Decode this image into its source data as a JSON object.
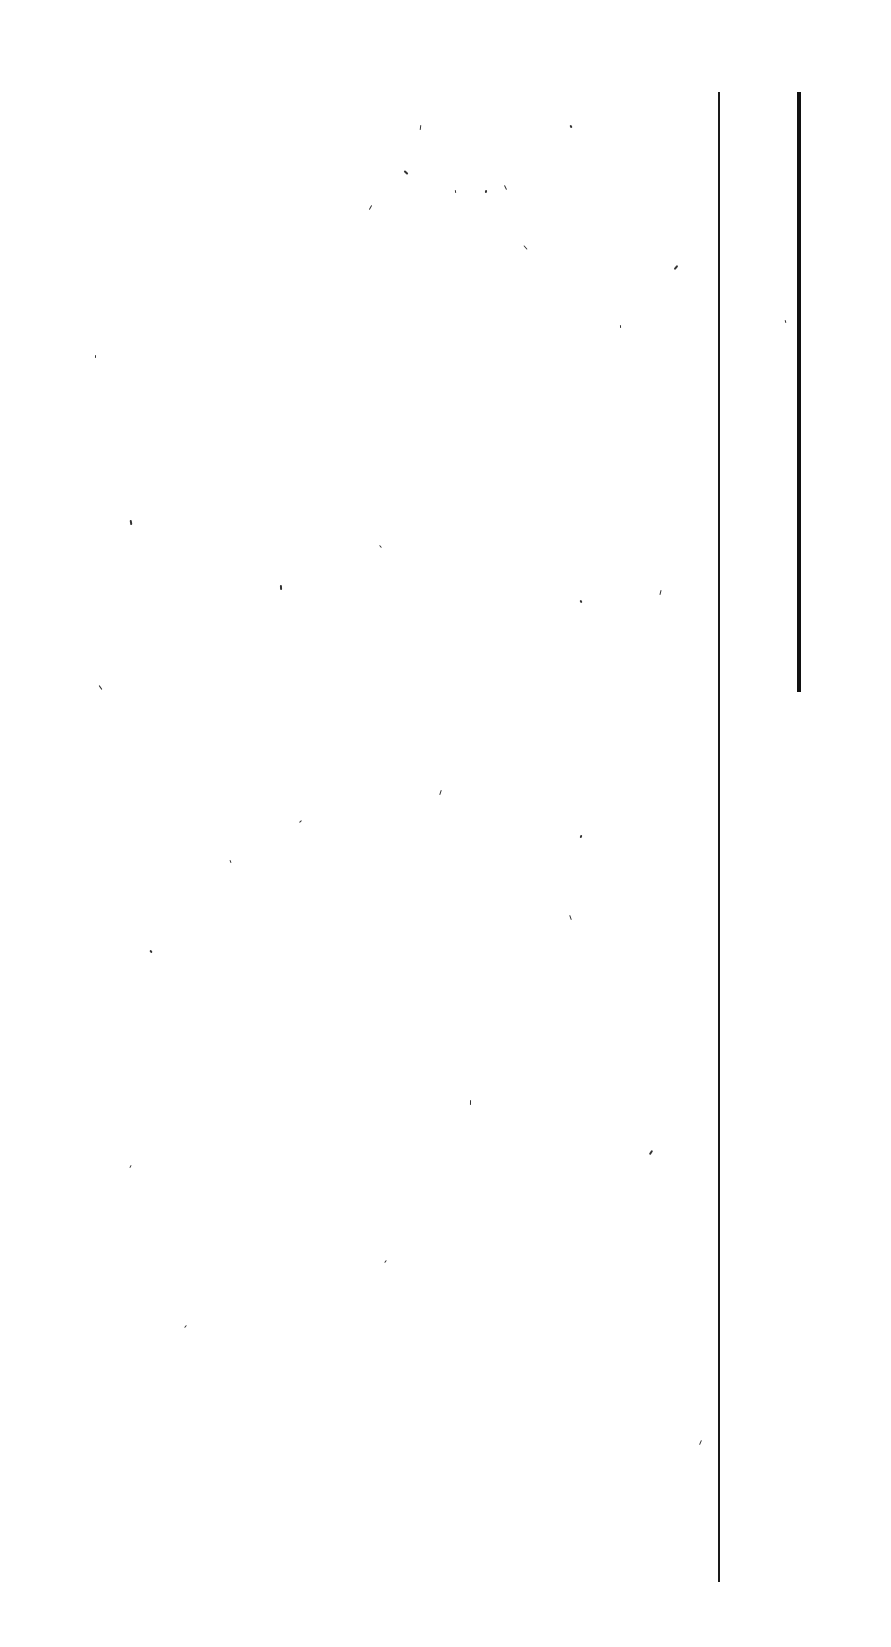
{
  "page": {
    "background": "#ffffff",
    "text_content": "",
    "rules": [
      {
        "name": "margin-rule-left",
        "x": 718,
        "y": 92,
        "height": 1490,
        "width": 2,
        "color": "#1a1a1a"
      },
      {
        "name": "margin-rule-right",
        "x": 797,
        "y": 92,
        "height": 600,
        "width": 4,
        "color": "#111111"
      }
    ],
    "specks": [
      [
        405,
        170
      ],
      [
        455,
        190
      ],
      [
        370,
        205
      ],
      [
        580,
        600
      ],
      [
        660,
        590
      ],
      [
        380,
        545
      ],
      [
        280,
        585
      ],
      [
        385,
        1260
      ],
      [
        570,
        915
      ],
      [
        580,
        835
      ],
      [
        100,
        685
      ],
      [
        95,
        355
      ],
      [
        675,
        265
      ],
      [
        785,
        320
      ],
      [
        700,
        1440
      ],
      [
        570,
        125
      ],
      [
        420,
        125
      ],
      [
        300,
        820
      ],
      [
        130,
        520
      ],
      [
        130,
        1165
      ],
      [
        505,
        185
      ],
      [
        485,
        190
      ],
      [
        525,
        245
      ],
      [
        620,
        325
      ],
      [
        650,
        1150
      ],
      [
        230,
        860
      ],
      [
        440,
        790
      ],
      [
        150,
        950
      ],
      [
        470,
        1100
      ],
      [
        185,
        1325
      ]
    ]
  }
}
